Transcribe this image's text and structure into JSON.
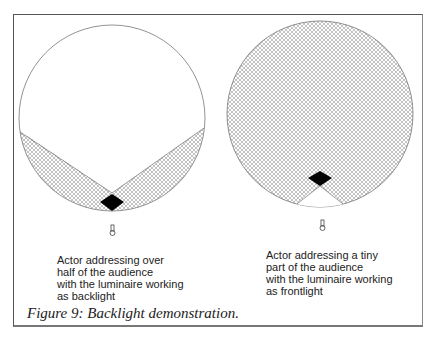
{
  "figure": {
    "caption": "Figure 9: Backlight demonstration.",
    "panels": [
      {
        "id": "backlight",
        "label": "Actor addressing over\nhalf of the audience\nwith the luminaire working\nas backlight"
      },
      {
        "id": "frontlight",
        "label": "Actor addressing a tiny\npart of the audience\nwith the luminaire working\nas frontlight"
      }
    ]
  }
}
